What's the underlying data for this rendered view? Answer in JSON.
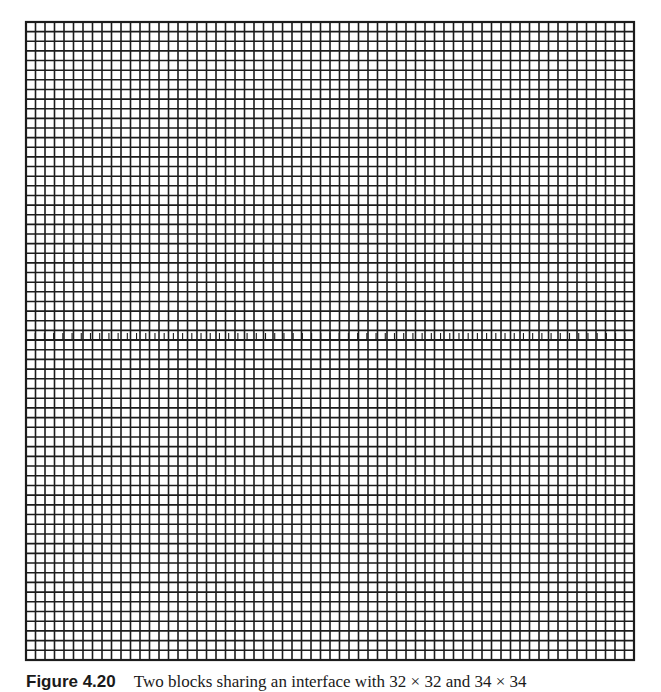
{
  "figure": {
    "bounds": {
      "left": 26,
      "top": 22,
      "right": 634,
      "bottom": 660
    },
    "interface_y": 340,
    "line_color": "#1c1c1c",
    "border_width": 2.2,
    "line_width": 1.6,
    "blocks": [
      {
        "name": "upper-block",
        "cols": 64,
        "rows": 33
      },
      {
        "name": "lower-block",
        "cols": 64,
        "rows": 33
      }
    ],
    "interface_band": {
      "cols": 66,
      "height": 7
    }
  },
  "caption": {
    "label": "Figure 4.20",
    "text": "Two blocks sharing an interface with 32 × 32 and 34 × 34"
  }
}
